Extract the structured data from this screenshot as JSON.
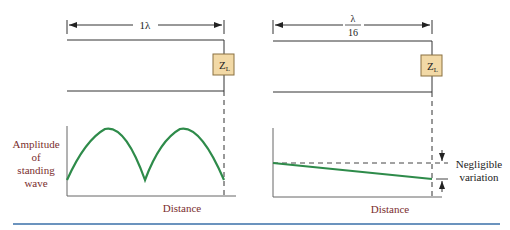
{
  "left_panel": {
    "dimension_label": "1λ",
    "load_label_main": "Z",
    "load_label_sub": "L",
    "y_axis_label": [
      "Amplitude",
      "of",
      "standing",
      "wave"
    ],
    "x_axis_label": "Distance"
  },
  "right_panel": {
    "dimension_num": "λ",
    "dimension_den": "16",
    "load_label_main": "Z",
    "load_label_sub": "L",
    "annotation": [
      "Negligible",
      "variation"
    ],
    "x_axis_label": "Distance"
  },
  "colors": {
    "curve": "#2e8b4a",
    "label_red": "#7a2e2e",
    "load_box": "#f2d9a6",
    "rule": "#3a6fa8"
  }
}
